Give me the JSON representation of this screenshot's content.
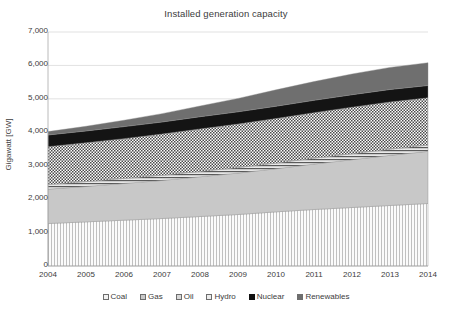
{
  "chart_data": {
    "type": "area",
    "title": "Installed generation capacity",
    "xlabel": "",
    "ylabel": "Gigawatt [GW]",
    "ylim": [
      0,
      7000
    ],
    "xlim": [
      2004,
      2014
    ],
    "grid": true,
    "stacked": true,
    "legend_position": "bottom",
    "x": [
      2004,
      2005,
      2006,
      2007,
      2008,
      2009,
      2010,
      2011,
      2012,
      2013,
      2014
    ],
    "categories": [
      "2004",
      "2005",
      "2006",
      "2007",
      "2008",
      "2009",
      "2010",
      "2011",
      "2012",
      "2013",
      "2014"
    ],
    "ytick_labels": [
      "0",
      "1,000",
      "2,000",
      "3,000",
      "4,000",
      "5,000",
      "6,000",
      "7,000"
    ],
    "ytick_values": [
      0,
      1000,
      2000,
      3000,
      4000,
      5000,
      6000,
      7000
    ],
    "series": [
      {
        "name": "Coal",
        "pattern": "vertical-lines",
        "color": "#f0f0f0",
        "values": [
          1270,
          1320,
          1370,
          1420,
          1480,
          1540,
          1620,
          1690,
          1750,
          1810,
          1870
        ]
      },
      {
        "name": "Gas",
        "pattern": "solid-light-gray",
        "color": "#c6c6c6",
        "values": [
          1030,
          1060,
          1100,
          1140,
          1190,
          1240,
          1290,
          1360,
          1430,
          1500,
          1560
        ]
      },
      {
        "name": "Oil",
        "pattern": "horizontal-lines",
        "color": "#d6d6d6",
        "values": [
          140,
          145,
          150,
          155,
          160,
          165,
          170,
          175,
          180,
          185,
          190
        ]
      },
      {
        "name": "Hydro",
        "pattern": "dotted-checker",
        "color": "#ebebeb",
        "values": [
          1130,
          1160,
          1190,
          1230,
          1270,
          1300,
          1330,
          1360,
          1390,
          1410,
          1410
        ]
      },
      {
        "name": "Nuclear",
        "pattern": "solid-black",
        "color": "#121212",
        "values": [
          350,
          355,
          360,
          363,
          366,
          368,
          370,
          372,
          374,
          376,
          370
        ]
      },
      {
        "name": "Renewables",
        "pattern": "solid-dark-gray",
        "color": "#6e6e6e",
        "values": [
          100,
          140,
          190,
          250,
          320,
          400,
          490,
          560,
          620,
          660,
          680
        ]
      }
    ],
    "cumulative_totals": {
      "Coal": [
        1270,
        1320,
        1370,
        1420,
        1480,
        1540,
        1620,
        1690,
        1750,
        1810,
        1870
      ],
      "Gas": [
        2300,
        2380,
        2470,
        2560,
        2670,
        2780,
        2910,
        3050,
        3180,
        3310,
        3430
      ],
      "Oil": [
        2440,
        2525,
        2620,
        2715,
        2830,
        2945,
        3080,
        3225,
        3360,
        3495,
        3620
      ],
      "Hydro": [
        3570,
        3685,
        3810,
        3945,
        4100,
        4245,
        4410,
        4585,
        4750,
        4905,
        5030
      ],
      "Nuclear": [
        3920,
        4040,
        4170,
        4308,
        4466,
        4613,
        4780,
        4957,
        5124,
        5281,
        5400
      ],
      "Renewables": [
        4020,
        4180,
        4360,
        4558,
        4786,
        5013,
        5270,
        5517,
        5744,
        5941,
        6080
      ]
    },
    "totals": [
      4020,
      4180,
      4360,
      4558,
      4786,
      5013,
      5270,
      5517,
      5744,
      5941,
      6080
    ]
  },
  "legend": {
    "items": [
      {
        "label": "Coal"
      },
      {
        "label": "Gas"
      },
      {
        "label": "Oil"
      },
      {
        "label": "Hydro"
      },
      {
        "label": "Nuclear"
      },
      {
        "label": "Renewables"
      }
    ]
  }
}
